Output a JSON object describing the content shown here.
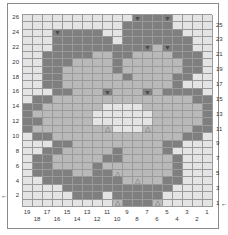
{
  "chart": {
    "title": "",
    "type": "knitting-colorwork-chart",
    "columns": 19,
    "rows": 26,
    "palette": {
      "L": "#e4e4e4",
      "M": "#b9b9b9",
      "D": "#7f7f7f",
      "grid": "#9a9a9a"
    },
    "row_labels_left": [
      "26",
      "24",
      "22",
      "20",
      "18",
      "16",
      "14",
      "12",
      "10",
      "8",
      "6",
      "4",
      "2"
    ],
    "row_labels_right": [
      "25",
      "23",
      "21",
      "19",
      "17",
      "15",
      "13",
      "11",
      "9",
      "7",
      "5",
      "3",
      "1"
    ],
    "col_labels_top_line": [
      "19",
      "17",
      "15",
      "13",
      "11",
      "9",
      "7",
      "5",
      "3",
      "1"
    ],
    "col_labels_bottom_line": [
      "18",
      "16",
      "14",
      "12",
      "10",
      "8",
      "6",
      "4",
      "2"
    ],
    "start_arrows": {
      "left_row": "2",
      "right_row": "1"
    },
    "legend": {
      "v": "down-triangle symbol",
      "^": "up-triangle symbol"
    },
    "grid_rows_top_to_bottom": [
      "LLLLLLLLLLLvDDvLLLL",
      "LLLLLLLLLLDDDDDLLLL",
      "LLLvDDDDLLDDDDDDLLL",
      "LLLDDDDDDLDDDDDDDLL",
      "LLLDDDDDDDDDvMvDDLL",
      "LLDDDDDMMDDMMMMDDDL",
      "LLDDDMMMMDMMMMMMDDL",
      "LLDDMMMMMDMMMMMMDDL",
      "LLDDMMMMMMDMMMMDDLL",
      "LLDDMMMMMMMMMMMDLLL",
      "LLLDDMMMvMMMvMDDDDL",
      "LDDMMMMMMMMMMMMMMDD",
      "DDMMMMMMLLLLMMMMMMD",
      "DMMMMMMLLLLLLMMMMMD",
      "DDMMMMMLLLLLLMMMMMD",
      "DMMMMMMM^LLL^MMMMDD",
      "LDDMMMMMMMMMMMMMDDL",
      "LLLDDMMMMMMMMMDDLLL",
      "LLDDMMMMMDMMMMDLLLL",
      "LDDMMMMMDDMMMMMDLLL",
      "LDDMMMMDMMMMMMMDLLL",
      "LDDDDMMDD^MMMMMDLLL",
      "LLDDDDDDDDM^MMDDLLL",
      "LLLLDDDDDDDDDDDLLLL",
      "LLLLLDDDLDDDDDLLLLL",
      "LLLLLLLLL^DDD^LLLLL"
    ]
  }
}
